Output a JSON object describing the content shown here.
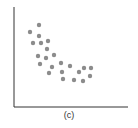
{
  "chart_data": {
    "type": "scatter",
    "title": "",
    "caption": "(c)",
    "xlabel": "",
    "ylabel": "",
    "xlim": [
      0,
      114
    ],
    "ylim": [
      0,
      100
    ],
    "grid": false,
    "legend": null,
    "tick_labels": false,
    "point_color": "#8c8c8c",
    "axis_color": "#333333",
    "points": [
      {
        "x": 25,
        "y": 82
      },
      {
        "x": 16,
        "y": 75
      },
      {
        "x": 25,
        "y": 71
      },
      {
        "x": 19,
        "y": 64
      },
      {
        "x": 27,
        "y": 64
      },
      {
        "x": 34,
        "y": 66
      },
      {
        "x": 33,
        "y": 58
      },
      {
        "x": 24,
        "y": 51
      },
      {
        "x": 32,
        "y": 49
      },
      {
        "x": 40,
        "y": 52
      },
      {
        "x": 26,
        "y": 43
      },
      {
        "x": 38,
        "y": 40
      },
      {
        "x": 47,
        "y": 44
      },
      {
        "x": 35,
        "y": 34
      },
      {
        "x": 48,
        "y": 35
      },
      {
        "x": 56,
        "y": 41
      },
      {
        "x": 49,
        "y": 28
      },
      {
        "x": 65,
        "y": 35
      },
      {
        "x": 70,
        "y": 39
      },
      {
        "x": 77,
        "y": 39
      },
      {
        "x": 60,
        "y": 27
      },
      {
        "x": 69,
        "y": 26
      },
      {
        "x": 76,
        "y": 31
      }
    ]
  }
}
